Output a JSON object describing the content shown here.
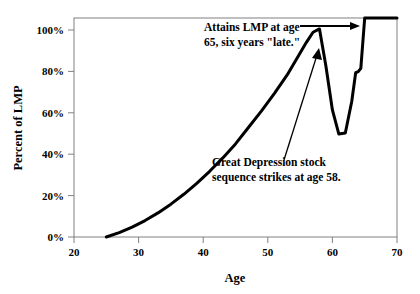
{
  "chart_data": {
    "type": "line",
    "title": "",
    "xlabel": "Age",
    "ylabel": "Percent of LMP",
    "xlim": [
      20,
      70
    ],
    "ylim": [
      0,
      100
    ],
    "grid": false,
    "legend": null,
    "x_ticks": [
      20,
      30,
      40,
      50,
      60,
      70
    ],
    "x_tick_labels": [
      "20",
      "30",
      "40",
      "50",
      "60",
      "70"
    ],
    "y_ticks": [
      0,
      20,
      40,
      60,
      80,
      100
    ],
    "y_tick_labels": [
      "0%",
      "20%",
      "40%",
      "60%",
      "80%",
      "100%"
    ],
    "series": [
      {
        "name": "Percent of LMP",
        "color": "#000000",
        "line_width": 3,
        "x": [
          25,
          27,
          29,
          31,
          33,
          35,
          37,
          39,
          41,
          43,
          45,
          47,
          49,
          51,
          53,
          55,
          56,
          57,
          58,
          59,
          60,
          61,
          62,
          63,
          63.6,
          64,
          64.4,
          65,
          67,
          70
        ],
        "values": [
          0,
          2,
          4.5,
          7.5,
          11,
          15,
          19.5,
          24.5,
          30,
          36,
          42.5,
          50,
          57.5,
          65.5,
          74,
          84,
          89,
          93.5,
          95,
          78,
          58,
          47,
          47.5,
          62,
          75,
          75.5,
          77,
          100,
          100,
          100
        ]
      }
    ],
    "annotations": [
      {
        "name": "attains-lmp-note",
        "lines": [
          "Attains LMP at age",
          "65, six years \"late.\""
        ],
        "arrow": "horizontal-right-to-plateau"
      },
      {
        "name": "great-depression-note",
        "lines": [
          "Great Depression stock",
          "sequence strikes at age 58."
        ],
        "arrow": "diagonal-up-to-peak"
      }
    ]
  },
  "axes": {
    "x_title": "Age",
    "y_title": "Percent of LMP"
  },
  "colors": {
    "line": "#000000",
    "frame": "#808080",
    "background": "#ffffff",
    "text": "#000000"
  }
}
